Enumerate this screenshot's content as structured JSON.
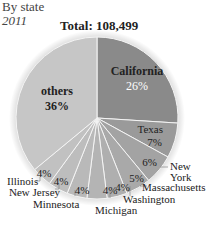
{
  "header": {
    "subtitle": "By state",
    "year": "2011",
    "total": "Total: 108,499"
  },
  "chart_data": {
    "type": "pie",
    "title": "Total: 108,499",
    "subtitle": "By state",
    "year": "2011",
    "total": 108499,
    "slices": [
      {
        "label": "California",
        "value": 26,
        "pct_label": "26%",
        "color": "#8a8a8a"
      },
      {
        "label": "Texas",
        "value": 7,
        "pct_label": "7%",
        "color": "#9a9a9a"
      },
      {
        "label": "New York",
        "value": 6,
        "pct_label": "6%",
        "color": "#a3a3a3"
      },
      {
        "label": "Massachusetts",
        "value": 5,
        "pct_label": "5%",
        "color": "#a9a9a9"
      },
      {
        "label": "Washington",
        "value": 4,
        "pct_label": "4%",
        "color": "#afafaf"
      },
      {
        "label": "Michigan",
        "value": 4,
        "pct_label": "4%",
        "color": "#b4b4b4"
      },
      {
        "label": "Minnesota",
        "value": 4,
        "pct_label": "4%",
        "color": "#b9b9b9"
      },
      {
        "label": "New Jersey",
        "value": 4,
        "pct_label": "4%",
        "color": "#bdbdbd"
      },
      {
        "label": "Illinois",
        "value": 4,
        "pct_label": "4%",
        "color": "#c1c1c1"
      },
      {
        "label": "others",
        "value": 36,
        "pct_label": "36%",
        "color": "#c6c6c6"
      }
    ],
    "units": "percent",
    "start_angle_deg": 0,
    "direction": "clockwise",
    "legend": "none (direct labels)"
  },
  "labels": {
    "california": "California",
    "california_pct": "26%",
    "texas": "Texas",
    "texas_pct": "7%",
    "newyork_1": "New",
    "newyork_2": "York",
    "newyork_pct": "6%",
    "massachusetts": "Massachusetts",
    "massachusetts_pct": "5%",
    "washington": "Washington",
    "washington_pct": "4%",
    "michigan": "Michigan",
    "michigan_pct": "4%",
    "minnesota": "Minnesota",
    "minnesota_pct": "4%",
    "newjersey": "New Jersey",
    "newjersey_pct": "4%",
    "illinois": "Illinois",
    "illinois_pct": "4%",
    "others": "others",
    "others_pct": "36%"
  }
}
